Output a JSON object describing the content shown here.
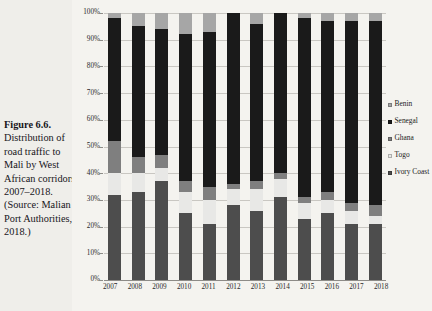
{
  "caption": {
    "figure_number": "Figure 6.6.",
    "text": "Distribution of road traffic to Mali by West African corridors, 2007–2018. (Source: Malian Port Authorities, 2018.)"
  },
  "legend": {
    "position": "right",
    "items": [
      {
        "label": "Benin",
        "color": "#a6a6a6"
      },
      {
        "label": "Senegal",
        "color": "#1a1a1a"
      },
      {
        "label": "Ghana",
        "color": "#7f7f7f"
      },
      {
        "label": "Togo",
        "color": "#e8e8e6"
      },
      {
        "label": "Ivory Coast",
        "color": "#4d4d4d"
      }
    ]
  },
  "axes": {
    "y_ticks": [
      "0%",
      "10%",
      "20%",
      "30%",
      "40%",
      "50%",
      "60%",
      "70%",
      "80%",
      "90%",
      "100%"
    ],
    "x_ticks": [
      "2007",
      "2008",
      "2009",
      "2010",
      "2011",
      "2012",
      "2013",
      "2014",
      "2015",
      "2016",
      "2017",
      "2018"
    ]
  },
  "chart_data": {
    "type": "bar",
    "stacked": true,
    "normalized": true,
    "title": "",
    "xlabel": "",
    "ylabel": "",
    "ylim": [
      0,
      100
    ],
    "grid": true,
    "legend_position": "right",
    "categories": [
      "2007",
      "2008",
      "2009",
      "2010",
      "2011",
      "2012",
      "2013",
      "2014",
      "2015",
      "2016",
      "2017",
      "2018"
    ],
    "stack_order_bottom_to_top": [
      "Ivory Coast",
      "Togo",
      "Ghana",
      "Senegal",
      "Benin"
    ],
    "series": [
      {
        "name": "Ivory Coast",
        "color": "#4d4d4d",
        "values": [
          32,
          33,
          37,
          25,
          21,
          28,
          26,
          31,
          23,
          25,
          21,
          21
        ]
      },
      {
        "name": "Togo",
        "color": "#e8e8e6",
        "values": [
          8,
          7,
          5,
          8,
          9,
          6,
          8,
          7,
          6,
          5,
          5,
          3
        ]
      },
      {
        "name": "Ghana",
        "color": "#7f7f7f",
        "values": [
          12,
          6,
          5,
          4,
          5,
          2,
          3,
          2,
          2,
          3,
          3,
          4
        ]
      },
      {
        "name": "Senegal",
        "color": "#1a1a1a",
        "values": [
          46,
          49,
          47,
          55,
          58,
          64,
          59,
          60,
          67,
          64,
          68,
          69
        ]
      },
      {
        "name": "Benin",
        "color": "#a6a6a6",
        "values": [
          2,
          5,
          6,
          8,
          7,
          0,
          4,
          0,
          2,
          3,
          3,
          3
        ]
      }
    ]
  }
}
